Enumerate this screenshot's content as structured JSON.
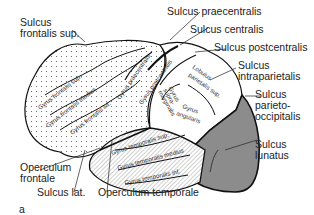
{
  "figure": {
    "panel_letter": "a",
    "colors": {
      "frontal_fill": "#ffffff",
      "frontal_dots": "#555555",
      "parietal_fill": "#ffffff",
      "temporal_hatch": "#666666",
      "occipital_fill": "#8c8c8c",
      "outline": "#111111"
    }
  },
  "callouts": {
    "sulcus_frontalis_sup": [
      "Sulcus",
      "frontalis sup."
    ],
    "sulcus_praecentralis": "Sulcus praecentralis",
    "sulcus_centralis": "Sulcus centralis",
    "sulcus_postcentralis": "Sulcus postcentralis",
    "sulcus_intraparietalis": [
      "Sulcus",
      "intraparietalis"
    ],
    "sulcus_parieto_occipitalis": [
      "Sulcus",
      "parieto-",
      "occipitalis"
    ],
    "sulcus_lunatus": [
      "Sulcus",
      "lunatus"
    ],
    "operculum_frontale": [
      "Operculum",
      "frontale"
    ],
    "sulcus_lat": "Sulcus lat.",
    "operculum_temporale": "Operculum temporale"
  },
  "gyri": {
    "frontalis_sup": "Gyrus frontalis sup.",
    "frontalis_medius": "Gyrus frontalis medius",
    "frontalis_inf": "Gyrus frontalis inf.",
    "praecentralis": "Gyrus praecentralis",
    "postcentralis": "Gyrus postcentralis",
    "lobulus_parietalis_sup": [
      "Lobulus",
      "parietalis sup."
    ],
    "supramarginalis": [
      "Gyrus",
      "supra-",
      "marginalis"
    ],
    "angularis": [
      "Gyrus",
      "angularis"
    ],
    "temporalis_sup": "Gyrus temporalis sup.",
    "temporalis_medius": "Gyrus temporalis medius",
    "temporalis_inf": "Gyrus temporalis inf."
  }
}
